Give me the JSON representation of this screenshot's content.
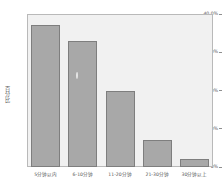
{
  "chart_data": {
    "type": "bar",
    "title": "",
    "xlabel": "",
    "ylabel": "百分比",
    "categories": [
      "5分钟以内",
      "6-10分钟",
      "11-20分钟",
      "21-30分钟",
      "30分钟以上"
    ],
    "values": [
      37.0,
      33.0,
      20.0,
      7.0,
      2.0
    ],
    "ylim": [
      0,
      40
    ],
    "ytick_labels": [
      "40.0%",
      "30.0%",
      "20.0%",
      "10.0%",
      "0%"
    ],
    "ytick_values": [
      40,
      30,
      20,
      10,
      0
    ],
    "grid": false,
    "legend": false,
    "series_name": "百分比",
    "colors": {
      "bar_fill": "#a8a8a8",
      "bar_border": "#7e7e7e",
      "plot_background": "#f1f1f1",
      "frame_border": "#b9b9b9",
      "page_background": "#ffffff",
      "text": "#444444"
    }
  }
}
